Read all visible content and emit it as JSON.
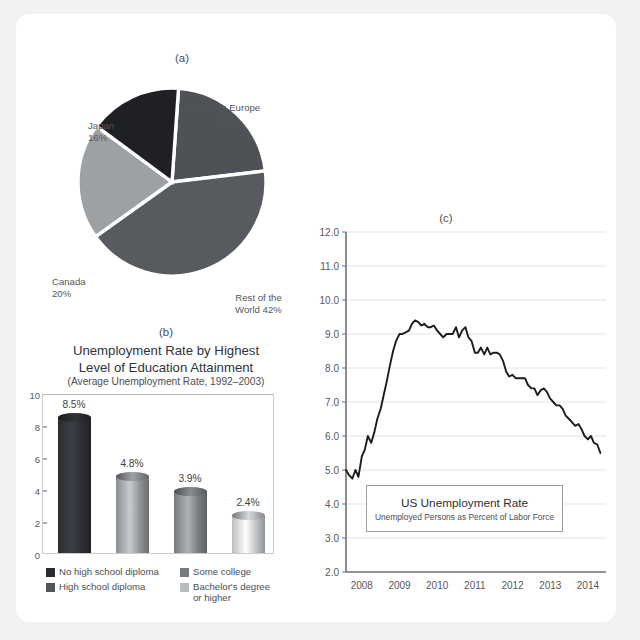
{
  "page": {
    "top_cut_text": "—  ·        · ·",
    "bg_color": "#f2f2f3",
    "card_color": "#ffffff"
  },
  "panel_a": {
    "letter": "(a)",
    "chart_data": {
      "type": "pie",
      "title": "",
      "legend_position": "callout-labels",
      "categories": [
        "Western Europe",
        "Rest of the World",
        "Canada",
        "Japan"
      ],
      "values": [
        22,
        42,
        20,
        16
      ],
      "labels": [
        {
          "name": "Western Europe",
          "value": "22%",
          "text_line1": "Western Europe",
          "text_line2": "22%"
        },
        {
          "name": "Rest of the World",
          "value": "42%",
          "text_line1": "Rest of the",
          "text_line2": "World 42%"
        },
        {
          "name": "Canada",
          "value": "20%",
          "text_line1": "Canada",
          "text_line2": "20%"
        },
        {
          "name": "Japan",
          "value": "16%",
          "text_line1": "Japan",
          "text_line2": "16%"
        }
      ],
      "colors": [
        "#4e5155",
        "#575a5e",
        "#9ea1a4",
        "#1e2024"
      ]
    }
  },
  "panel_b": {
    "letter": "(b)",
    "title_line1": "Unemployment Rate by Highest",
    "title_line2": "Level of Education Attainment",
    "subtitle": "(Average Unemployment Rate, 1992–2003)",
    "chart_data": {
      "type": "bar",
      "title": "Unemployment Rate by Highest Level of Education Attainment",
      "subtitle": "(Average Unemployment Rate, 1992–2003)",
      "xlabel": "",
      "ylabel": "",
      "ylim": [
        0,
        10
      ],
      "yticks": [
        "0",
        "2",
        "4",
        "6",
        "8",
        "10"
      ],
      "grid": false,
      "categories": [
        "No high school diploma",
        "High school diploma",
        "Some college",
        "Bachelor's degree or higher"
      ],
      "values": [
        8.5,
        4.8,
        3.9,
        2.4
      ],
      "data_labels": [
        "8.5%",
        "4.8%",
        "3.9%",
        "2.4%"
      ],
      "colors": [
        "#2a2c30",
        "#8a8d90",
        "#777a7d",
        "#b9bcbf"
      ]
    },
    "legend": [
      {
        "label": "No high school diploma",
        "color": "#2a2c30"
      },
      {
        "label": "Some college",
        "color": "#777a7d"
      },
      {
        "label": "High school diploma",
        "color": "#52555a"
      },
      {
        "label": "Bachelor's degree",
        "label2": "or higher",
        "color": "#b9bcbf"
      }
    ]
  },
  "panel_c": {
    "letter": "(c)",
    "box_title": "US Unemployment Rate",
    "box_subtitle": "Unemployed Persons as Percent of Labor Force",
    "chart_data": {
      "type": "line",
      "title": "US Unemployment Rate",
      "subtitle": "Unemployed Persons as Percent of Labor Force",
      "xlabel": "",
      "ylabel": "",
      "ylim": [
        2.0,
        12.0
      ],
      "yticks": [
        "2.0",
        "3.0",
        "4.0",
        "5.0",
        "6.0",
        "7.0",
        "8.0",
        "9.0",
        "10.0",
        "11.0",
        "12.0"
      ],
      "xticks": [
        "2008",
        "2009",
        "2010",
        "2011",
        "2012",
        "2013",
        "2014"
      ],
      "xlim": [
        2008.0,
        2014.9
      ],
      "grid": true,
      "grid_axis": "y",
      "line_color": "#1a1c20",
      "series": [
        {
          "name": "US Unemployment Rate",
          "x": [
            2008.0,
            2008.08,
            2008.17,
            2008.25,
            2008.33,
            2008.42,
            2008.5,
            2008.58,
            2008.67,
            2008.75,
            2008.83,
            2008.92,
            2009.0,
            2009.08,
            2009.17,
            2009.25,
            2009.33,
            2009.42,
            2009.5,
            2009.58,
            2009.67,
            2009.75,
            2009.83,
            2009.92,
            2010.0,
            2010.08,
            2010.17,
            2010.25,
            2010.33,
            2010.42,
            2010.5,
            2010.58,
            2010.67,
            2010.75,
            2010.83,
            2010.92,
            2011.0,
            2011.08,
            2011.17,
            2011.25,
            2011.33,
            2011.42,
            2011.5,
            2011.58,
            2011.67,
            2011.75,
            2011.83,
            2011.92,
            2012.0,
            2012.08,
            2012.17,
            2012.25,
            2012.33,
            2012.42,
            2012.5,
            2012.58,
            2012.67,
            2012.75,
            2012.83,
            2012.92,
            2013.0,
            2013.08,
            2013.17,
            2013.25,
            2013.33,
            2013.42,
            2013.5,
            2013.58,
            2013.67,
            2013.75,
            2013.83,
            2013.92,
            2014.0,
            2014.08,
            2014.17,
            2014.25,
            2014.33,
            2014.42,
            2014.5,
            2014.58,
            2014.67,
            2014.75
          ],
          "values": [
            5.0,
            4.85,
            4.75,
            5.0,
            4.8,
            5.4,
            5.6,
            6.0,
            5.8,
            6.1,
            6.5,
            6.8,
            7.2,
            7.6,
            8.1,
            8.5,
            8.8,
            9.0,
            9.0,
            9.05,
            9.1,
            9.3,
            9.4,
            9.35,
            9.25,
            9.3,
            9.2,
            9.2,
            9.25,
            9.1,
            9.0,
            8.9,
            9.0,
            9.0,
            9.0,
            9.2,
            8.9,
            9.1,
            9.2,
            8.9,
            8.8,
            8.45,
            8.45,
            8.6,
            8.4,
            8.6,
            8.4,
            8.45,
            8.45,
            8.4,
            8.2,
            7.9,
            7.75,
            7.8,
            7.7,
            7.7,
            7.7,
            7.7,
            7.5,
            7.4,
            7.4,
            7.2,
            7.35,
            7.4,
            7.3,
            7.1,
            7.0,
            6.9,
            6.9,
            6.8,
            6.6,
            6.5,
            6.4,
            6.3,
            6.35,
            6.2,
            6.0,
            5.9,
            6.0,
            5.8,
            5.75,
            5.5
          ]
        }
      ]
    }
  }
}
